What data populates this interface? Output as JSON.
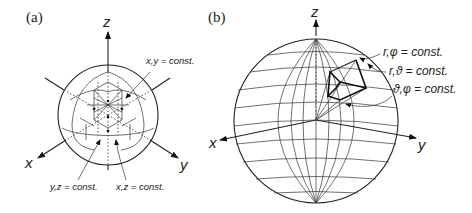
{
  "panel_a": {
    "label": "(a)",
    "axes": {
      "x": "x",
      "y": "y",
      "z": "z"
    },
    "annotations": {
      "xy_const": "x,y = const.",
      "yz_const": "y,z = const.",
      "xz_const": "x,z = const."
    }
  },
  "panel_b": {
    "label": "(b)",
    "axes": {
      "x": "x",
      "y": "y",
      "z": "z"
    },
    "annotations": {
      "r_phi_const": "r,φ = const.",
      "r_theta_const": "r,ϑ = const.",
      "theta_phi_const": "ϑ,φ = const."
    }
  }
}
